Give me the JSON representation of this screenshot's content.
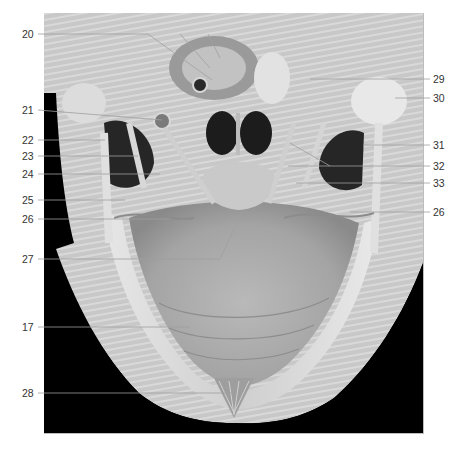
{
  "figure": {
    "background_color": "#000000",
    "tissue_color": "#b8b8b8",
    "leader_color": "#9a9a9a",
    "label_color": "#333333"
  },
  "labels_left": [
    {
      "id": "20",
      "text": "20",
      "y": 34,
      "line_to": [
        148,
        34
      ]
    },
    {
      "id": "21",
      "text": "21",
      "y": 110,
      "line_to": [
        145,
        110
      ]
    },
    {
      "id": "22",
      "text": "22",
      "y": 140,
      "line_to": [
        105,
        140
      ]
    },
    {
      "id": "23",
      "text": "23",
      "y": 156,
      "line_to": [
        138,
        156
      ]
    },
    {
      "id": "24",
      "text": "24",
      "y": 174,
      "line_to": [
        148,
        174
      ]
    },
    {
      "id": "25",
      "text": "25",
      "y": 200,
      "line_to": [
        125,
        200
      ]
    },
    {
      "id": "26",
      "text": "26",
      "y": 219,
      "line_to": [
        170,
        219
      ]
    },
    {
      "id": "27",
      "text": "27",
      "y": 259,
      "line_to": [
        220,
        259
      ]
    },
    {
      "id": "17",
      "text": "17",
      "y": 327,
      "line_to": [
        190,
        327
      ]
    },
    {
      "id": "28",
      "text": "28",
      "y": 393,
      "line_to": [
        237,
        393
      ]
    }
  ],
  "labels_right": [
    {
      "id": "29",
      "text": "29",
      "y": 79,
      "line_to": [
        310,
        79
      ]
    },
    {
      "id": "30",
      "text": "30",
      "y": 98,
      "line_to": [
        395,
        98
      ]
    },
    {
      "id": "31",
      "text": "31",
      "y": 145,
      "line_to": [
        363,
        145
      ]
    },
    {
      "id": "32",
      "text": "32",
      "y": 166,
      "line_to": [
        288,
        166
      ]
    },
    {
      "id": "33",
      "text": "33",
      "y": 183,
      "line_to": [
        296,
        183
      ]
    },
    {
      "id": "26r",
      "text": "26",
      "y": 212,
      "line_to": [
        350,
        212
      ]
    }
  ]
}
